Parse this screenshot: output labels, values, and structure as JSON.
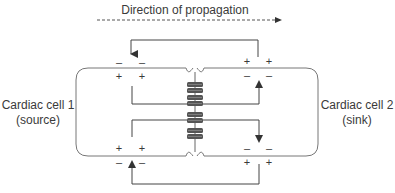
{
  "title": "Direction of propagation",
  "cells": [
    {
      "name": "Cardiac cell 1",
      "role": "(source)"
    },
    {
      "name": "Cardiac cell 2",
      "role": "(sink)"
    }
  ],
  "charges": {
    "plus": "+",
    "minus": "–"
  },
  "colors": {
    "line": "#444444",
    "cell_border": "#777777",
    "junction_fill": "#555555",
    "text": "#3a3a3a"
  }
}
